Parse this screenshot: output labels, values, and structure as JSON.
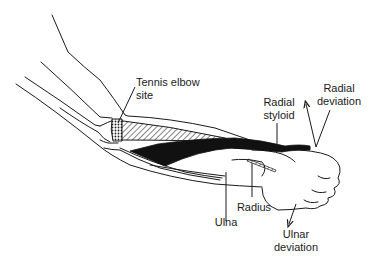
{
  "diagram": {
    "colors": {
      "line": "#1a1a1a",
      "fill_dark": "#111111",
      "background": "#ffffff"
    },
    "labels": {
      "tennis_elbow_l1": "Tennis elbow",
      "tennis_elbow_l2": "site",
      "radial_styloid_l1": "Radial",
      "radial_styloid_l2": "styloid",
      "radial_deviation_l1": "Radial",
      "radial_deviation_l2": "deviation",
      "radius": "Radius",
      "ulna": "Ulna",
      "ulnar_deviation_l1": "Ulnar",
      "ulnar_deviation_l2": "deviation"
    }
  }
}
